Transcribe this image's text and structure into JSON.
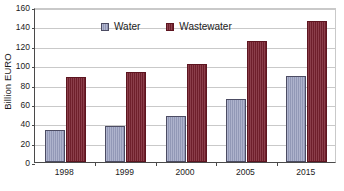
{
  "chart_data": {
    "type": "bar",
    "title": "",
    "subtitle": "",
    "xlabel": "",
    "ylabel": "Billion EURO",
    "categories": [
      "1998",
      "1999",
      "2000",
      "2005",
      "2015"
    ],
    "series": [
      {
        "name": "Water",
        "color": "#9aa0c0",
        "border_color": "#4c4c63",
        "values": [
          33,
          37.5,
          48,
          65,
          88.5
        ]
      },
      {
        "name": "Wastewater",
        "color": "#7a2230",
        "border_color": "#5d1520",
        "values": [
          87.5,
          93,
          101,
          125,
          145.5
        ]
      }
    ],
    "ylim": [
      0,
      160
    ],
    "ytick_values": [
      0,
      20,
      40,
      60,
      80,
      100,
      120,
      140,
      160
    ],
    "ytick_labels": [
      "0",
      "20",
      "40",
      "60",
      "80",
      "100",
      "120",
      "140",
      "160"
    ],
    "grid": true,
    "grid_axis": "y",
    "grid_color": "#c9c9c9",
    "legend_position": "top-center-left",
    "legend_entries": [
      "Water",
      "Wastewater"
    ],
    "axis_color": "#4a4a4a",
    "background_color": "#ffffff"
  }
}
